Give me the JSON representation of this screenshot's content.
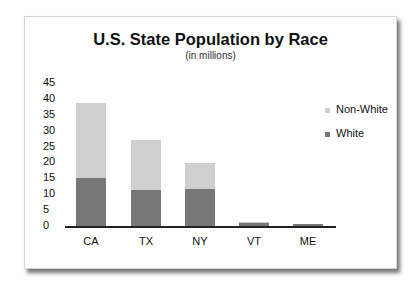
{
  "chart_data": {
    "type": "bar",
    "stacked": true,
    "title": "U.S. State Population by Race",
    "subtitle": "(in millions)",
    "xlabel": "",
    "ylabel": "",
    "categories": [
      "CA",
      "TX",
      "NY",
      "VT",
      "ME"
    ],
    "series": [
      {
        "name": "White",
        "color": "#777777",
        "values": [
          15.2,
          11.2,
          11.6,
          1.2,
          0.6
        ]
      },
      {
        "name": "Non-White",
        "color": "#cfcfcf",
        "values": [
          23.6,
          15.8,
          8.2,
          0.1,
          0.0
        ]
      }
    ],
    "yticks": [
      "45",
      "40",
      "35",
      "30",
      "25",
      "20",
      "15",
      "10",
      "5",
      "0"
    ],
    "ylim": [
      0,
      45
    ],
    "grid": false,
    "legend": {
      "position": "right",
      "entries": [
        "Non-White",
        "White"
      ]
    }
  }
}
